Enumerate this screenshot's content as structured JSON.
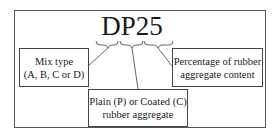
{
  "diagram": {
    "code": "DP25",
    "segments": [
      {
        "id": "mix-type",
        "chars": "D",
        "label_lines": [
          "Mix type",
          "(A, B, C or D)"
        ]
      },
      {
        "id": "aggregate-type",
        "chars": "P",
        "label_lines": [
          "Plain (P) or Coated (C)",
          "rubber aggregate"
        ]
      },
      {
        "id": "percentage",
        "chars": "25",
        "label_lines": [
          "Percentage of rubber",
          "aggregate content"
        ]
      }
    ]
  },
  "colors": {
    "line": "#444444",
    "text": "#1a1a1a",
    "background": "#ffffff"
  }
}
